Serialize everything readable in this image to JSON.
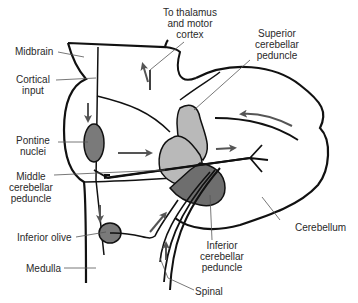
{
  "diagram": {
    "colors": {
      "outline": "#111111",
      "light_gray": "#b9b9b9",
      "dark_gray": "#6e6e6e",
      "nuclei_gray": "#7a7a7a",
      "leader": "#555555",
      "arrow": "#555555",
      "text": "#2a2a2a"
    },
    "labels": {
      "to_thalamus": [
        "To thalamus",
        "and motor",
        "cortex"
      ],
      "superior": [
        "Superior",
        "cerebellar",
        "peduncle"
      ],
      "midbrain": "Midbrain",
      "cortical_input": [
        "Cortical",
        "input"
      ],
      "pontine_nuclei": [
        "Pontine",
        "nuclei"
      ],
      "middle": [
        "Middle",
        "cerebellar",
        "peduncle"
      ],
      "inferior_olive": "Inferior olive",
      "medulla": "Medulla",
      "inferior_peduncle": [
        "Inferior",
        "cerebellar",
        "peduncle"
      ],
      "cerebellum": "Cerebellum",
      "spinal": "Spinal"
    }
  }
}
